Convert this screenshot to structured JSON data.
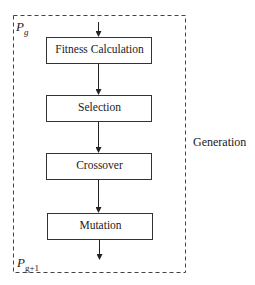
{
  "diagram": {
    "container_label": "Generation",
    "input_label": {
      "base": "P",
      "sub": "g"
    },
    "output_label": {
      "base": "P",
      "sub": "g+1"
    },
    "steps": [
      {
        "label": "Fitness Calculation"
      },
      {
        "label": "Selection"
      },
      {
        "label": "Crossover"
      },
      {
        "label": "Mutation"
      }
    ]
  }
}
